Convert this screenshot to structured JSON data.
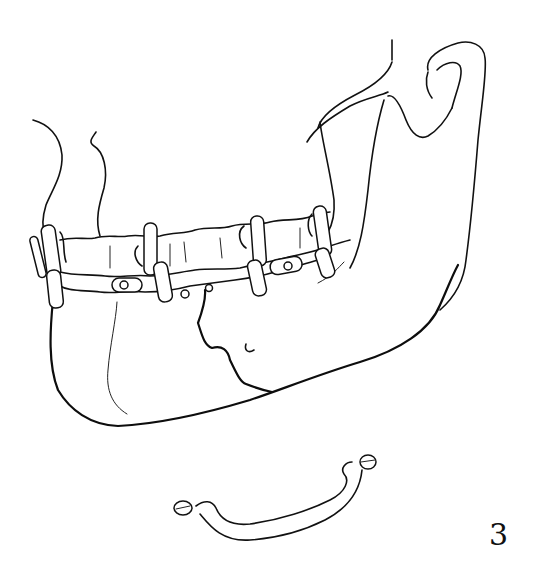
{
  "figure": {
    "number": "3",
    "colors": {
      "line": "#111111",
      "background": "#ffffff"
    }
  }
}
